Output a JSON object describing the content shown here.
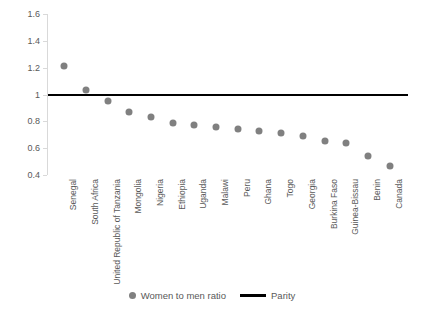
{
  "chart_data": {
    "type": "scatter",
    "title": "",
    "xlabel": "",
    "ylabel": "",
    "ylim": [
      0.4,
      1.6
    ],
    "yticks": [
      0.4,
      0.6,
      0.8,
      1.0,
      1.2,
      1.4,
      1.6
    ],
    "ytick_labels": [
      "0.4",
      "0.6",
      "0.8",
      "1",
      "1.2",
      "1.4",
      "1.6"
    ],
    "grid": false,
    "legend_position": "bottom",
    "categories": [
      "Senegal",
      "South Africa",
      "United Republic of Tanzania",
      "Mongolia",
      "Nigeria",
      "Ethiopia",
      "Uganda",
      "Malawi",
      "Peru",
      "Ghana",
      "Togo",
      "Georgia",
      "Burkina Faso",
      "Guinea-Bissau",
      "Benin",
      "Canada"
    ],
    "series": [
      {
        "name": "Women to men ratio",
        "type": "scatter",
        "color": "#808080",
        "values": [
          1.21,
          1.03,
          0.95,
          0.87,
          0.83,
          0.79,
          0.77,
          0.76,
          0.745,
          0.73,
          0.715,
          0.69,
          0.655,
          0.64,
          0.54,
          0.47
        ]
      },
      {
        "name": "Parity",
        "type": "line",
        "color": "#000000",
        "constant": 1.0
      }
    ],
    "legend": [
      {
        "label": "Women to men ratio",
        "marker": "dot",
        "color": "#808080"
      },
      {
        "label": "Parity",
        "marker": "line",
        "color": "#000000"
      }
    ]
  }
}
